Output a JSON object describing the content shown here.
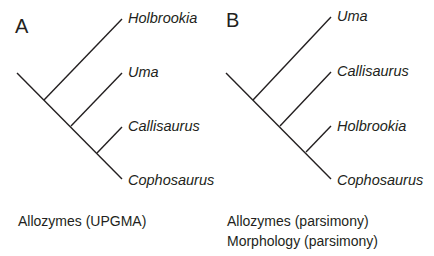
{
  "figure": {
    "panels": [
      {
        "letter": "A",
        "method_lines": [
          "Allozymes (UPGMA)"
        ],
        "taxa_top_to_bottom": [
          "Holbrookia",
          "Uma",
          "Callisaurus",
          "Cophosaurus"
        ],
        "topology": "(Holbrookia,(Uma,(Callisaurus,Cophosaurus)))"
      },
      {
        "letter": "B",
        "method_lines": [
          "Allozymes (parsimony)",
          "Morphology (parsimony)"
        ],
        "taxa_top_to_bottom": [
          "Uma",
          "Callisaurus",
          "Holbrookia",
          "Cophosaurus"
        ],
        "topology": "(Uma,(Callisaurus,(Holbrookia,Cophosaurus)))"
      }
    ],
    "colors": {
      "line": "#231f20",
      "text": "#231f20",
      "background": "#ffffff"
    }
  }
}
